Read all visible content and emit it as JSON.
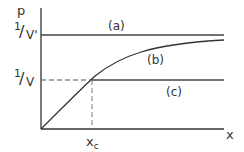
{
  "diagram": {
    "y_axis_label": "p",
    "x_axis_label": "x",
    "y_ticks": [
      {
        "numerator": "1",
        "denominator": "V'"
      },
      {
        "numerator": "1",
        "denominator": "V"
      }
    ],
    "x_tick": {
      "main": "x",
      "sub": "c"
    },
    "curves": [
      {
        "label": "(a)",
        "type": "horizontal",
        "level": "1/V'"
      },
      {
        "label": "(b)",
        "type": "concave increasing, asymptotic to 1/V'"
      },
      {
        "label": "(c)",
        "type": "horizontal",
        "level": "1/V"
      }
    ],
    "colors": {
      "line": "#333333",
      "dashed": "#555555"
    }
  }
}
